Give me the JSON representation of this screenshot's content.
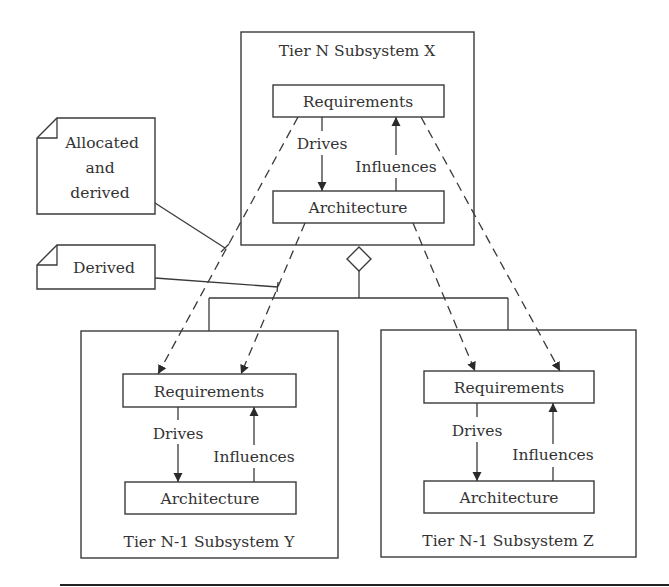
{
  "diagram": {
    "top_subsystem": {
      "title": "Tier N Subsystem X",
      "requirements_label": "Requirements",
      "architecture_label": "Architecture",
      "drives_label": "Drives",
      "influences_label": "Influences"
    },
    "left_subsystem": {
      "title": "Tier N-1 Subsystem Y",
      "requirements_label": "Requirements",
      "architecture_label": "Architecture",
      "drives_label": "Drives",
      "influences_label": "Influences"
    },
    "right_subsystem": {
      "title": "Tier N-1 Subsystem Z",
      "requirements_label": "Requirements",
      "architecture_label": "Architecture",
      "drives_label": "Drives",
      "influences_label": "Influences"
    },
    "notes": {
      "allocated": {
        "line1": "Allocated",
        "line2": "and",
        "line3": "derived"
      },
      "derived": {
        "text": "Derived"
      }
    },
    "colors": {
      "stroke": "#3a3a3a",
      "text": "#333333",
      "background": "#ffffff"
    }
  }
}
